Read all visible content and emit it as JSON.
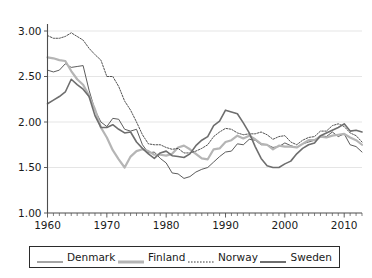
{
  "chart_data": {
    "type": "line",
    "title": "",
    "subtitle": "",
    "xlabel": "",
    "ylabel": "",
    "xlim": [
      1960,
      2013
    ],
    "ylim": [
      1.0,
      3.0
    ],
    "grid": true,
    "legend_position": "bottom",
    "y_ticks": [
      "1.00",
      "1.50",
      "2.00",
      "2.50",
      "3.00"
    ],
    "y_tick_values": [
      1.0,
      1.5,
      2.0,
      2.5,
      3.0
    ],
    "x_ticks": [
      "1960",
      "1970",
      "1980",
      "1990",
      "2000",
      "2010"
    ],
    "x_tick_values": [
      1960,
      1970,
      1980,
      1990,
      2000,
      2010
    ],
    "x_minor_tick_step": 1,
    "x": [
      1960,
      1961,
      1962,
      1963,
      1964,
      1965,
      1966,
      1967,
      1968,
      1969,
      1970,
      1971,
      1972,
      1973,
      1974,
      1975,
      1976,
      1977,
      1978,
      1979,
      1980,
      1981,
      1982,
      1983,
      1984,
      1985,
      1986,
      1987,
      1988,
      1989,
      1990,
      1991,
      1992,
      1993,
      1994,
      1995,
      1996,
      1997,
      1998,
      1999,
      2000,
      2001,
      2002,
      2003,
      2004,
      2005,
      2006,
      2007,
      2008,
      2009,
      2010,
      2011,
      2012,
      2013
    ],
    "series": [
      {
        "name": "Denmark",
        "color": "#4a4a4a",
        "width": 0.9,
        "style": "solid",
        "values": [
          2.57,
          2.55,
          2.57,
          2.64,
          2.6,
          2.61,
          2.62,
          2.35,
          2.13,
          2.0,
          1.95,
          2.04,
          2.03,
          1.92,
          1.9,
          1.92,
          1.75,
          1.66,
          1.67,
          1.6,
          1.55,
          1.44,
          1.43,
          1.38,
          1.4,
          1.45,
          1.48,
          1.5,
          1.56,
          1.62,
          1.67,
          1.68,
          1.76,
          1.75,
          1.81,
          1.8,
          1.75,
          1.75,
          1.72,
          1.73,
          1.77,
          1.74,
          1.72,
          1.76,
          1.78,
          1.8,
          1.85,
          1.84,
          1.89,
          1.84,
          1.87,
          1.75,
          1.73,
          1.67
        ]
      },
      {
        "name": "Finland",
        "color": "#b5b5b5",
        "width": 2.2,
        "style": "solid",
        "values": [
          2.71,
          2.7,
          2.68,
          2.67,
          2.56,
          2.47,
          2.41,
          2.29,
          2.14,
          1.94,
          1.83,
          1.69,
          1.59,
          1.5,
          1.62,
          1.68,
          1.7,
          1.68,
          1.64,
          1.64,
          1.63,
          1.65,
          1.72,
          1.74,
          1.7,
          1.65,
          1.6,
          1.59,
          1.7,
          1.71,
          1.78,
          1.8,
          1.85,
          1.82,
          1.85,
          1.81,
          1.76,
          1.75,
          1.7,
          1.74,
          1.73,
          1.73,
          1.72,
          1.76,
          1.8,
          1.8,
          1.84,
          1.83,
          1.85,
          1.86,
          1.87,
          1.83,
          1.8,
          1.75
        ]
      },
      {
        "name": "Norway",
        "color": "#3d3d3d",
        "width": 0.9,
        "style": "dotted",
        "values": [
          2.95,
          2.92,
          2.92,
          2.94,
          2.98,
          2.94,
          2.9,
          2.81,
          2.74,
          2.68,
          2.5,
          2.5,
          2.39,
          2.23,
          2.13,
          2.0,
          1.86,
          1.76,
          1.75,
          1.75,
          1.72,
          1.7,
          1.71,
          1.66,
          1.66,
          1.68,
          1.71,
          1.75,
          1.84,
          1.89,
          1.93,
          1.92,
          1.88,
          1.86,
          1.87,
          1.87,
          1.89,
          1.86,
          1.81,
          1.84,
          1.85,
          1.78,
          1.75,
          1.8,
          1.83,
          1.84,
          1.9,
          1.9,
          1.96,
          1.98,
          1.95,
          1.88,
          1.85,
          1.78
        ]
      },
      {
        "name": "Sweden",
        "color": "#6e6e6e",
        "width": 1.6,
        "style": "solid",
        "values": [
          2.2,
          2.24,
          2.28,
          2.33,
          2.47,
          2.41,
          2.36,
          2.28,
          2.07,
          1.94,
          1.94,
          1.97,
          1.92,
          1.88,
          1.89,
          1.78,
          1.71,
          1.65,
          1.6,
          1.66,
          1.68,
          1.63,
          1.62,
          1.61,
          1.65,
          1.74,
          1.8,
          1.84,
          1.96,
          2.01,
          2.13,
          2.11,
          2.09,
          1.99,
          1.88,
          1.73,
          1.6,
          1.52,
          1.5,
          1.5,
          1.54,
          1.57,
          1.65,
          1.71,
          1.75,
          1.77,
          1.85,
          1.88,
          1.91,
          1.94,
          1.98,
          1.9,
          1.91,
          1.89
        ]
      }
    ],
    "legend": [
      {
        "label": "Denmark",
        "color": "#4a4a4a",
        "style": "solid",
        "width": 1
      },
      {
        "label": "Finland",
        "color": "#b5b5b5",
        "style": "solid",
        "width": 3
      },
      {
        "label": "Norway",
        "color": "#3d3d3d",
        "style": "dotted",
        "width": 1
      },
      {
        "label": "Sweden",
        "color": "#6e6e6e",
        "style": "solid",
        "width": 2
      }
    ]
  }
}
